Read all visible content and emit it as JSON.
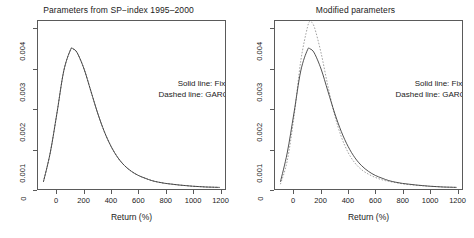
{
  "figure": {
    "background": "#ffffff",
    "line_color": "#3c3c3c",
    "axis_color": "#5a5a5a"
  },
  "legend": {
    "solid": "Solid line: Fixed volatilities",
    "dashed": "Dashed line: GARCH volatilities"
  },
  "axes": {
    "xlabel": "Return (%)",
    "xticks": [
      "0",
      "200",
      "400",
      "600",
      "800",
      "1000",
      "1200"
    ],
    "xtick_values": [
      0,
      200,
      400,
      600,
      800,
      1000,
      1200
    ],
    "yticks": [
      "0",
      "0.001",
      "0.002",
      "0.003",
      "0.004"
    ],
    "ytick_values": [
      0,
      0.001,
      0.002,
      0.003,
      0.004
    ],
    "xlim": [
      -140,
      1240
    ],
    "ylim": [
      0,
      0.0042
    ]
  },
  "chart_data": [
    {
      "type": "line",
      "title": "Parameters from SP−index 1995–2000",
      "xlabel": "Return (%)",
      "ylabel": "",
      "xlim": [
        -140,
        1240
      ],
      "ylim": [
        0,
        0.0042
      ],
      "grid": false,
      "legend_position": "center-right",
      "x": [
        -100,
        -50,
        0,
        50,
        100,
        120,
        150,
        200,
        250,
        300,
        350,
        400,
        450,
        500,
        550,
        600,
        650,
        700,
        750,
        800,
        850,
        900,
        950,
        1000,
        1050,
        1100,
        1150,
        1200
      ],
      "series": [
        {
          "name": "Fixed volatilities",
          "style": "solid",
          "values": [
            0.00018,
            0.0009,
            0.0019,
            0.00295,
            0.00348,
            0.0035,
            0.0034,
            0.003,
            0.00245,
            0.0019,
            0.00143,
            0.00106,
            0.00078,
            0.00058,
            0.00044,
            0.00034,
            0.00027,
            0.00021,
            0.00017,
            0.00014,
            0.00012,
            0.0001,
            8.5e-05,
            7e-05,
            6e-05,
            5e-05,
            4.5e-05,
            4e-05
          ]
        },
        {
          "name": "GARCH volatilities",
          "style": "dashed",
          "values": [
            0.00018,
            0.0009,
            0.0019,
            0.00295,
            0.00348,
            0.0035,
            0.0034,
            0.003,
            0.00245,
            0.0019,
            0.00143,
            0.00106,
            0.00078,
            0.00058,
            0.00044,
            0.00034,
            0.00027,
            0.00021,
            0.00017,
            0.00014,
            0.00012,
            0.0001,
            8.5e-05,
            7e-05,
            6e-05,
            5e-05,
            4.5e-05,
            4e-05
          ]
        }
      ]
    },
    {
      "type": "line",
      "title": "Modified parameters",
      "xlabel": "Return (%)",
      "ylabel": "",
      "xlim": [
        -140,
        1240
      ],
      "ylim": [
        0,
        0.0042
      ],
      "grid": false,
      "legend_position": "center-right",
      "x": [
        -100,
        -50,
        0,
        50,
        100,
        120,
        150,
        200,
        250,
        300,
        350,
        400,
        450,
        500,
        550,
        600,
        650,
        700,
        750,
        800,
        850,
        900,
        950,
        1000,
        1050,
        1100,
        1150,
        1200
      ],
      "series": [
        {
          "name": "Fixed volatilities",
          "style": "solid",
          "values": [
            0.00018,
            0.0009,
            0.0019,
            0.00295,
            0.00348,
            0.0035,
            0.0034,
            0.003,
            0.00245,
            0.0019,
            0.00143,
            0.00106,
            0.00078,
            0.00058,
            0.00044,
            0.00034,
            0.00027,
            0.00021,
            0.00017,
            0.00014,
            0.00012,
            0.0001,
            8.5e-05,
            7e-05,
            6e-05,
            5e-05,
            4.5e-05,
            4e-05
          ]
        },
        {
          "name": "GARCH volatilities",
          "style": "dashed",
          "values": [
            0.00012,
            0.0007,
            0.0018,
            0.0032,
            0.00405,
            0.00418,
            0.00405,
            0.0034,
            0.00258,
            0.00185,
            0.0013,
            0.00091,
            0.00065,
            0.00048,
            0.00037,
            0.00029,
            0.00023,
            0.00019,
            0.00016,
            0.00013,
            0.00011,
            9.5e-05,
            8e-05,
            7e-05,
            6e-05,
            5e-05,
            4.5e-05,
            4e-05
          ]
        }
      ]
    }
  ]
}
